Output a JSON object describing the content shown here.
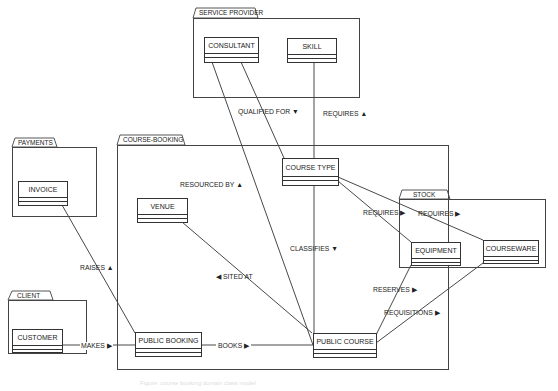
{
  "packages": [
    {
      "id": "service-provider",
      "label": "SERVICE PROVIDER"
    },
    {
      "id": "payments",
      "label": "PAYMENTS"
    },
    {
      "id": "course-booking",
      "label": "COURSE-BOOKING"
    },
    {
      "id": "stock",
      "label": "STOCK"
    },
    {
      "id": "client",
      "label": "CLIENT"
    }
  ],
  "classes": {
    "consultant": "CONSULTANT",
    "skill": "SKILL",
    "invoice": "INVOICE",
    "venue": "VENUE",
    "course_type": "COURSE TYPE",
    "equipment": "EQUIPMENT",
    "courseware": "COURSEWARE",
    "customer": "CUSTOMER",
    "public_booking": "PUBLIC BOOKING",
    "public_course": "PUBLIC COURSE"
  },
  "associations": {
    "qualified_for": "QUALIFIED FOR ▼",
    "requires_skill": "REQUIRES ▲",
    "resourced_by": "RESOURCED BY ▲",
    "raises": "RAISES ▲",
    "requires_equipment": "REQUIRES ▶",
    "requires_courseware": "REQUIRES ▶",
    "classifies": "CLASSIFIES ▼",
    "sited_at": "◀ SITED AT",
    "reserves": "RESERVES ▶",
    "requisitions": "REQUISITIONS ▶",
    "makes": "MAKES ▶",
    "books": "BOOKS ▶"
  },
  "caption": "Figure: course booking domain class model"
}
